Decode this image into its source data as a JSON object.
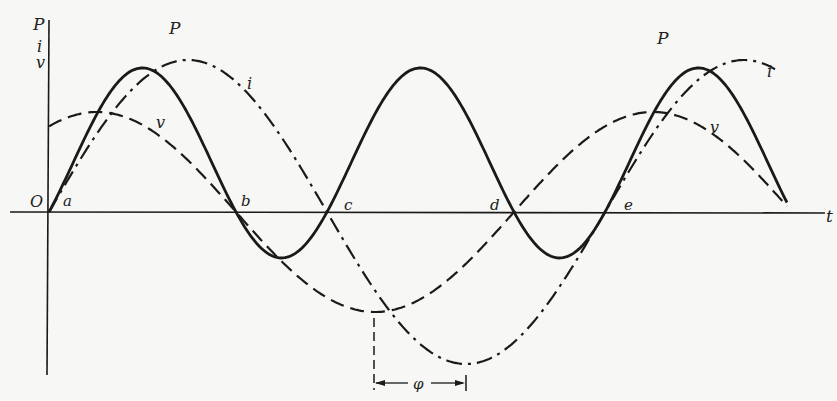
{
  "diagram": {
    "axis_labels": {
      "vertical": [
        "P",
        "i",
        "v"
      ],
      "horizontal": "t",
      "origin": "O"
    },
    "points": [
      {
        "label": "a",
        "x": 49
      },
      {
        "label": "b",
        "x": 236
      },
      {
        "label": "c",
        "x": 328
      },
      {
        "label": "d",
        "x": 513
      },
      {
        "label": "e",
        "x": 606
      }
    ],
    "curves": [
      {
        "name": "P",
        "style": "solid",
        "labels": [
          "P",
          "P"
        ]
      },
      {
        "name": "i",
        "style": "dash-dot",
        "labels": [
          "i",
          "i"
        ]
      },
      {
        "name": "v",
        "style": "dashed",
        "labels": [
          "v",
          "v"
        ]
      }
    ],
    "phase_label": "φ",
    "colors": {
      "ink": "#1a1a1a",
      "background": "#f7f7f5"
    }
  }
}
